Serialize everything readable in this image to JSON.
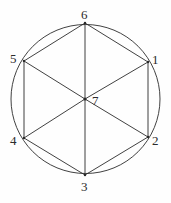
{
  "figure": {
    "background_color": "#fefefe",
    "line_color": "#2b2b2b",
    "label_color": "#2b2b2b"
  },
  "chart_data": {
    "type": "diagram",
    "title": "",
    "shape": "circle with inscribed regular hexagon and center vertex",
    "circle": {
      "cx": 85.5,
      "cy": 99,
      "r": 74.5
    },
    "nodes": [
      {
        "id": "1",
        "label": "1",
        "x": 148,
        "y": 62,
        "label_x": 152,
        "label_y": 53,
        "label_position": "right"
      },
      {
        "id": "2",
        "label": "2",
        "x": 148,
        "y": 137,
        "label_x": 152,
        "label_y": 134,
        "label_position": "right"
      },
      {
        "id": "3",
        "label": "3",
        "x": 85,
        "y": 175,
        "label_x": 81,
        "label_y": 180,
        "label_position": "below"
      },
      {
        "id": "4",
        "label": "4",
        "x": 24,
        "y": 138,
        "label_x": 10,
        "label_y": 134,
        "label_position": "left"
      },
      {
        "id": "5",
        "label": "5",
        "x": 24,
        "y": 61,
        "label_x": 10,
        "label_y": 52,
        "label_position": "left"
      },
      {
        "id": "6",
        "label": "6",
        "x": 85,
        "y": 23,
        "label_x": 81,
        "label_y": 8,
        "label_position": "above"
      },
      {
        "id": "7",
        "label": "7",
        "x": 85,
        "y": 99,
        "label_x": 92,
        "label_y": 94,
        "label_position": "right"
      }
    ],
    "edges": [
      {
        "from": "1",
        "to": "2"
      },
      {
        "from": "2",
        "to": "3"
      },
      {
        "from": "3",
        "to": "4"
      },
      {
        "from": "4",
        "to": "5"
      },
      {
        "from": "5",
        "to": "6"
      },
      {
        "from": "6",
        "to": "1"
      },
      {
        "from": "1",
        "to": "7"
      },
      {
        "from": "2",
        "to": "7"
      },
      {
        "from": "3",
        "to": "7"
      },
      {
        "from": "4",
        "to": "7"
      },
      {
        "from": "5",
        "to": "7"
      },
      {
        "from": "6",
        "to": "7"
      }
    ],
    "node_count": 7,
    "edge_count": 12
  }
}
